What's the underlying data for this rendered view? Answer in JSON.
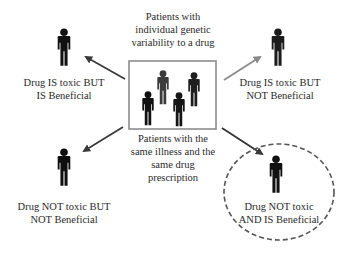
{
  "center": {
    "top_caption": "Patients with\nindividual genetic\nvariability to a drug",
    "bottom_caption": "Patients with the\nsame illness and the\nsame drug\nprescription"
  },
  "outcomes": [
    {
      "id": "toxic-beneficial",
      "label": "Drug IS toxic BUT\nIS Beneficial",
      "position": "top-left",
      "arrow_color": "#4a4a4a"
    },
    {
      "id": "toxic-not-beneficial",
      "label": "Drug IS toxic BUT\nNOT Beneficial",
      "position": "top-right",
      "arrow_color": "#8a8a8a"
    },
    {
      "id": "not-toxic-not-beneficial",
      "label": "Drug NOT toxic BUT\nNOT Beneficial",
      "position": "bottom-left",
      "arrow_color": "#4a4a4a"
    },
    {
      "id": "not-toxic-beneficial",
      "label": "Drug NOT toxic\nAND IS Beneficial",
      "position": "bottom-right",
      "arrow_color": "#333333",
      "highlighted": true
    }
  ],
  "colors": {
    "figure": "#111111",
    "figure_gray": "#3a3a3a",
    "box_border": "#8c8c8c",
    "dashed_circle": "#555555"
  }
}
